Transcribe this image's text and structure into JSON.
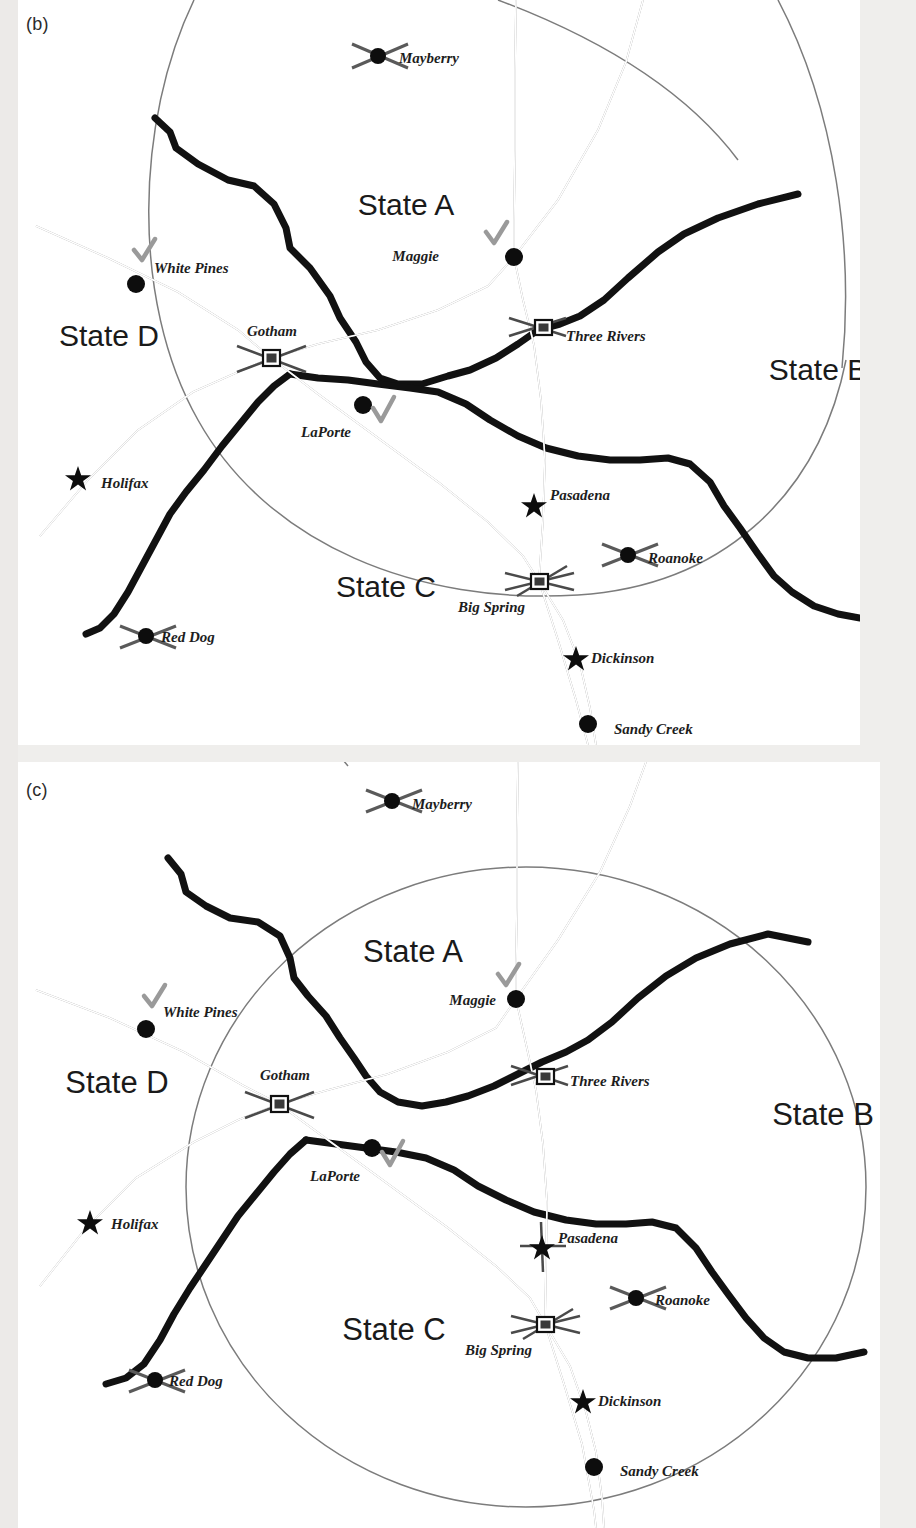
{
  "figure": {
    "panels": [
      {
        "tag": "(b)",
        "states": [
          {
            "name": "State A",
            "x": 388,
            "y": 215
          },
          {
            "name": "State B",
            "x": 800,
            "y": 380
          },
          {
            "name": "State C",
            "x": 368,
            "y": 597
          },
          {
            "name": "State D",
            "x": 91,
            "y": 346
          }
        ],
        "cities": [
          {
            "name": "Mayberry",
            "symbol": "airport-marker",
            "mx": 360,
            "my": 56,
            "lx": 381,
            "ly": 63,
            "checked": false
          },
          {
            "name": "White Pines",
            "symbol": "circle-marker",
            "mx": 118,
            "my": 284,
            "lx": 136,
            "ly": 273,
            "checked": true
          },
          {
            "name": "Maggie",
            "symbol": "circle-marker",
            "mx": 496,
            "my": 257,
            "lx": 421,
            "ly": 261,
            "checked": true
          },
          {
            "name": "Gotham",
            "symbol": "square-marker",
            "mx": 253,
            "my": 358,
            "lx": 229,
            "ly": 336,
            "checked": false
          },
          {
            "name": "Three Rivers",
            "symbol": "square-marker",
            "mx": 525,
            "my": 327,
            "lx": 548,
            "ly": 341,
            "checked": false
          },
          {
            "name": "LaPorte",
            "symbol": "circle-marker",
            "mx": 345,
            "my": 405,
            "lx": 283,
            "ly": 437,
            "checked": true
          },
          {
            "name": "Holifax",
            "symbol": "star-marker",
            "mx": 60,
            "my": 477,
            "lx": 83,
            "ly": 488,
            "checked": false
          },
          {
            "name": "Pasadena",
            "symbol": "star-marker",
            "mx": 516,
            "my": 504,
            "lx": 532,
            "ly": 500,
            "checked": false
          },
          {
            "name": "Roanoke",
            "symbol": "airport-marker",
            "mx": 610,
            "my": 555,
            "lx": 630,
            "ly": 563,
            "checked": false
          },
          {
            "name": "Big Spring",
            "symbol": "square-marker",
            "mx": 521,
            "my": 581,
            "lx": 440,
            "ly": 612,
            "checked": false
          },
          {
            "name": "Red Dog",
            "symbol": "airport-marker",
            "mx": 128,
            "my": 636,
            "lx": 143,
            "ly": 642,
            "checked": false
          },
          {
            "name": "Dickinson",
            "symbol": "star-marker",
            "mx": 558,
            "my": 657,
            "lx": 573,
            "ly": 663,
            "checked": false
          },
          {
            "name": "Sandy Creek",
            "symbol": "circle-marker",
            "mx": 570,
            "my": 724,
            "lx": 596,
            "ly": 734,
            "checked": false
          }
        ]
      },
      {
        "tag": "(c)",
        "states": [
          {
            "name": "State A",
            "x": 377,
            "y": 192
          },
          {
            "name": "State B",
            "x": 803,
            "y": 355
          },
          {
            "name": "State C",
            "x": 358,
            "y": 570
          },
          {
            "name": "State D",
            "x": 85,
            "y": 322
          }
        ],
        "cities": [
          {
            "name": "Mayberry",
            "symbol": "airport-marker",
            "mx": 374,
            "my": 37,
            "lx": 392,
            "ly": 46,
            "checked": false
          },
          {
            "name": "White Pines",
            "symbol": "circle-marker",
            "mx": 128,
            "my": 1029,
            "lx": 145,
            "ly": 1015,
            "checked": true
          },
          {
            "name": "Maggie",
            "symbol": "circle-marker",
            "mx": 498,
            "my": 999,
            "lx": 426,
            "ly": 1003,
            "checked": true
          },
          {
            "name": "Gotham",
            "symbol": "square-marker",
            "mx": 261,
            "my": 1104,
            "lx": 242,
            "ly": 1077,
            "checked": false
          },
          {
            "name": "Three Rivers",
            "symbol": "square-marker",
            "mx": 527,
            "my": 1076,
            "lx": 552,
            "ly": 1082,
            "checked": false
          },
          {
            "name": "LaPorte",
            "symbol": "circle-marker",
            "mx": 354,
            "my": 1148,
            "lx": 292,
            "ly": 1181,
            "checked": true
          },
          {
            "name": "Holifax",
            "symbol": "star-marker",
            "mx": 72,
            "my": 1221,
            "lx": 93,
            "ly": 1229,
            "checked": false
          },
          {
            "name": "Pasadena",
            "symbol": "star-marker",
            "mx": 524,
            "my": 1246,
            "lx": 538,
            "ly": 1241,
            "checked": false
          },
          {
            "name": "Roanoke",
            "symbol": "airport-marker",
            "mx": 618,
            "my": 1298,
            "lx": 637,
            "ly": 1305,
            "checked": false
          },
          {
            "name": "Big Spring",
            "symbol": "square-marker",
            "mx": 527,
            "my": 1324,
            "lx": 447,
            "ly": 1352,
            "checked": false
          },
          {
            "name": "Red Dog",
            "symbol": "airport-marker",
            "mx": 137,
            "my": 1380,
            "lx": 151,
            "ly": 1383,
            "checked": false
          },
          {
            "name": "Dickinson",
            "symbol": "star-marker",
            "mx": 565,
            "my": 1400,
            "lx": 580,
            "ly": 1406,
            "checked": false
          },
          {
            "name": "Sandy Creek",
            "symbol": "circle-marker",
            "mx": 576,
            "my": 1467,
            "lx": 602,
            "ly": 1474,
            "checked": false
          }
        ]
      }
    ],
    "colors": {
      "river": "#111111",
      "road": "#8d8d8d",
      "boundary": "#7c7c7c",
      "marker": "#0d0d0d",
      "check": "#9a9a9a",
      "panel_background": "#ffffff",
      "page_background": "#efeeec"
    }
  },
  "panel_b": {
    "tag": "(b)",
    "state_a": "State A",
    "state_b": "State B",
    "state_c": "State C",
    "state_d": "State D",
    "c": {
      "mayberry": "Mayberry",
      "white_pines": "White Pines",
      "maggie": "Maggie",
      "gotham": "Gotham",
      "three_rivers": "Three Rivers",
      "laporte": "LaPorte",
      "holifax": "Holifax",
      "pasadena": "Pasadena",
      "roanoke": "Roanoke",
      "big_spring": "Big Spring",
      "red_dog": "Red Dog",
      "dickinson": "Dickinson",
      "sandy_creek": "Sandy Creek"
    }
  },
  "panel_c": {
    "tag": "(c)",
    "state_a": "State A",
    "state_b": "State B",
    "state_c": "State C",
    "state_d": "State D",
    "c": {
      "mayberry": "Mayberry",
      "white_pines": "White Pines",
      "maggie": "Maggie",
      "gotham": "Gotham",
      "three_rivers": "Three Rivers",
      "laporte": "LaPorte",
      "holifax": "Holifax",
      "pasadena": "Pasadena",
      "roanoke": "Roanoke",
      "big_spring": "Big Spring",
      "red_dog": "Red Dog",
      "dickinson": "Dickinson",
      "sandy_creek": "Sandy Creek"
    }
  }
}
